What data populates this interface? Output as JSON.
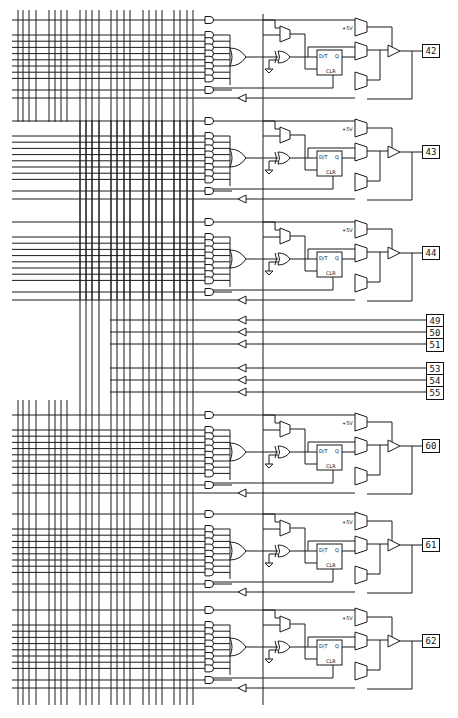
{
  "diagram": {
    "type": "logic-schematic",
    "supply_label": "+5V",
    "flipflop": {
      "data_label": "D/T",
      "q_label": "Q",
      "clear_label": "CLR"
    },
    "macrocells": [
      {
        "pin": "42",
        "y": 0
      },
      {
        "pin": "43",
        "y": 101
      },
      {
        "pin": "44",
        "y": 202
      },
      {
        "pin": "60",
        "y": 395
      },
      {
        "pin": "61",
        "y": 494
      },
      {
        "pin": "62",
        "y": 590
      }
    ],
    "input_pins": [
      {
        "pin": "49",
        "y": 320
      },
      {
        "pin": "50",
        "y": 332
      },
      {
        "pin": "51",
        "y": 344
      },
      {
        "pin": "53",
        "y": 368
      },
      {
        "pin": "54",
        "y": 380
      },
      {
        "pin": "55",
        "y": 392
      }
    ]
  }
}
